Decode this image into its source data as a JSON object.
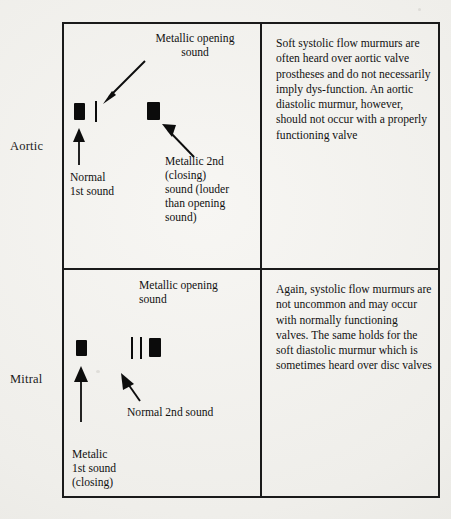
{
  "document": {
    "background_color": "#f2f1ee",
    "ink_color": "#141414"
  },
  "table": {
    "rows": [
      {
        "row_label": "Aortic",
        "diagram": {
          "opening_sound_caption": "Metallic opening\nsound",
          "first_sound_caption": "Normal\n1st sound",
          "second_sound_caption": "Metallic 2nd\n(closing)\nsound (louder\nthan opening\nsound)"
        },
        "commentary": "Soft systolic flow murmurs are often heard over aortic valve prostheses and do not necessarily imply dys-function.  An aortic diastolic murmur, however, should not occur with a properly functioning valve"
      },
      {
        "row_label": "Mitral",
        "diagram": {
          "opening_sound_caption": "Metallic opening\nsound",
          "first_sound_caption": "Metalic\n1st sound\n(closing)",
          "second_sound_caption": "Normal 2nd sound"
        },
        "commentary": "Again, systolic flow murmurs are not uncommon and may occur with normally functioning valves. The same holds for the soft diastolic murmur which is sometimes heard over disc valves"
      }
    ]
  }
}
